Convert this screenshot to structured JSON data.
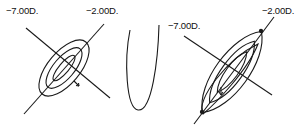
{
  "figures": [
    {
      "id": "left",
      "labels": {
        "axis_a": "−7.00D.",
        "axis_b": "−2.00D."
      },
      "ellipse_count": 3
    },
    {
      "id": "middle",
      "shape": "narrow-u-curve"
    },
    {
      "id": "right",
      "labels": {
        "axis_a": "−7.00D.",
        "axis_b": "−2.00D."
      },
      "ellipse_count": 3
    }
  ],
  "colors": {
    "stroke": "#1a1a1a",
    "background": "#ffffff"
  }
}
